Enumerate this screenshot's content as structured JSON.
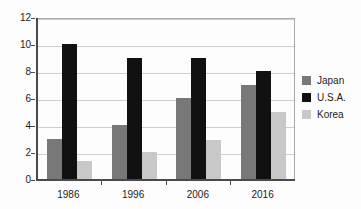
{
  "chart_data": {
    "type": "bar",
    "title": "",
    "subtitle": "",
    "xlabel": "",
    "ylabel": "",
    "categories": [
      "1986",
      "1996",
      "2006",
      "2016"
    ],
    "series": [
      {
        "name": "Japan",
        "color": "#787878",
        "values": [
          3,
          4,
          6,
          7
        ]
      },
      {
        "name": "U.S.A.",
        "color": "#111111",
        "values": [
          10,
          9,
          9,
          8
        ]
      },
      {
        "name": "Korea",
        "color": "#c8c8c8",
        "values": [
          1.3,
          2,
          2.9,
          5
        ]
      }
    ],
    "ylim": [
      0,
      12
    ],
    "yticks": [
      0,
      2,
      4,
      6,
      8,
      10,
      12
    ],
    "ytick_labels": [
      "0",
      "2",
      "4",
      "6",
      "8",
      "10",
      "12"
    ],
    "grid": true,
    "grid_axis": "y",
    "legend_position": "right",
    "frame": true
  },
  "legend": {
    "entries": [
      {
        "label": "Japan",
        "color": "#787878"
      },
      {
        "label": "U.S.A.",
        "color": "#111111"
      },
      {
        "label": "Korea",
        "color": "#c8c8c8"
      }
    ]
  },
  "colors": {
    "background": "#fdfdfd",
    "axis": "#4a4a4a",
    "grid": "#cfcfcf",
    "frame": "#a9a9a9",
    "text": "#1c1c1c"
  }
}
